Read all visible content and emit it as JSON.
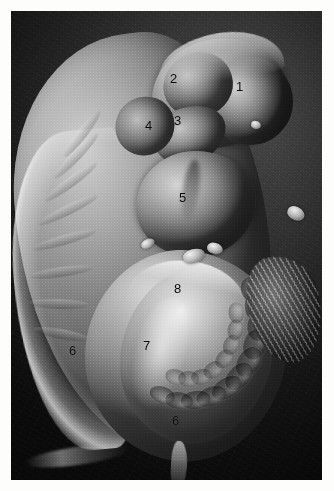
{
  "figure": {
    "kind": "scanning-electron-micrograph",
    "background_color": "#1d1d1d",
    "plate_border_color": "#ffffff",
    "label_color": "#0a0a0a"
  },
  "labels": [
    {
      "text": "1",
      "x": 236,
      "y": 80,
      "name": "label-1-forebrain"
    },
    {
      "text": "2",
      "x": 170,
      "y": 72,
      "name": "label-2-midbrain"
    },
    {
      "text": "3",
      "x": 174,
      "y": 114,
      "name": "label-3-branchial-arch"
    },
    {
      "text": "4",
      "x": 145,
      "y": 119,
      "name": "label-4-branchial-arch"
    },
    {
      "text": "5",
      "x": 179,
      "y": 191,
      "name": "label-5-heart-bulge"
    },
    {
      "text": "6",
      "x": 69,
      "y": 344,
      "name": "label-6-left"
    },
    {
      "text": "7",
      "x": 143,
      "y": 339,
      "name": "label-7-limb-bud"
    },
    {
      "text": "8",
      "x": 174,
      "y": 282,
      "name": "label-8-dorsal"
    },
    {
      "text": "6",
      "x": 172,
      "y": 414,
      "name": "label-6-bottom"
    }
  ],
  "somites": {
    "count": 11,
    "note": "segmented blocks along caudal body"
  }
}
